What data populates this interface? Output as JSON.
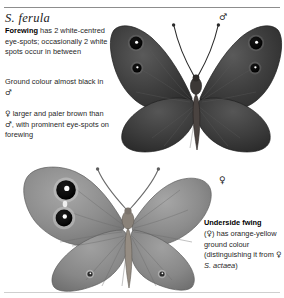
{
  "page": {
    "species_title": "S. ferula",
    "rules": {
      "top_color": "#8d8d8d",
      "bottom_color": "#cfcfcf"
    }
  },
  "symbols": {
    "male": "♂",
    "female": "♀"
  },
  "text_blocks": [
    {
      "id": "forewing-note",
      "lead_bold": "Forewing",
      "body": " has 2 white-centred eye-spots; occasionally 2 white spots occur in between"
    },
    {
      "id": "ground-colour-note",
      "body_before": "Ground colour almost black in ",
      "symbol": "♂",
      "body_after": ""
    },
    {
      "id": "female-note",
      "symbol_lead": "♀",
      "body_1": " larger and paler brown than ",
      "symbol_mid": "♂",
      "body_2": ", with prominent eye-spots on forewing"
    }
  ],
  "caption": {
    "heading": "Underside fwing",
    "line_1_before": "(",
    "line_1_symbol": "♀",
    "line_1_after": ") has orange-yellow ground colour",
    "line_2": "(distinguishing it from ",
    "line_2_symbol": "♀",
    "line_2_species": "S. actaea",
    "line_2_end": ")"
  },
  "plates": [
    {
      "id": "male-upperside",
      "sex": "♂",
      "label": "male-butterfly-upperside",
      "ground_colour": "#3a3a3a",
      "wing_dark": "#343434",
      "wing_mid": "#4a4a4a",
      "eyespot_ring": "#d6d6d6",
      "eyespot_core": "#0b0b0b",
      "eyespot_pupil": "#ffffff",
      "eyespot_count_forewing": 2
    },
    {
      "id": "female-underside",
      "sex": "♀",
      "label": "female-butterfly-underside",
      "ground_colour": "#8a8a8a",
      "wing_dark": "#7a7a7a",
      "wing_mid": "#9a9a9a",
      "eyespot_ring": "#cfcfcf",
      "eyespot_core": "#101010",
      "eyespot_pupil": "#ffffff",
      "eyespot_count_forewing": 2
    }
  ]
}
